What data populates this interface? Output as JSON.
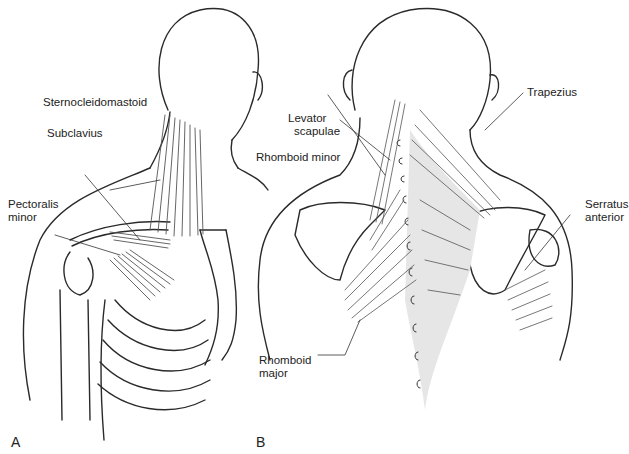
{
  "figure": {
    "panels": [
      {
        "id": "A",
        "label": "A",
        "view": "anterior",
        "muscles": [
          {
            "name": "Sternocleidomastoid",
            "label_lines": [
              "Sternocleidomastoid"
            ]
          },
          {
            "name": "Subclavius",
            "label_lines": [
              "Subclavius"
            ]
          },
          {
            "name": "Pectoralis minor",
            "label_lines": [
              "Pectoralis",
              "minor"
            ]
          }
        ]
      },
      {
        "id": "B",
        "label": "B",
        "view": "posterior",
        "muscles": [
          {
            "name": "Levator scapulae",
            "label_lines": [
              "Levator",
              "scapulae"
            ]
          },
          {
            "name": "Rhomboid minor",
            "label_lines": [
              "Rhomboid minor"
            ]
          },
          {
            "name": "Trapezius",
            "label_lines": [
              "Trapezius"
            ]
          },
          {
            "name": "Serratus anterior",
            "label_lines": [
              "Serratus",
              "anterior"
            ]
          },
          {
            "name": "Rhomboid major",
            "label_lines": [
              "Rhomboid",
              "major"
            ]
          }
        ]
      }
    ],
    "colors": {
      "line": "#2a2a2a",
      "muscle": "#555555",
      "shade": "#e6e6e6",
      "background": "#ffffff"
    }
  }
}
